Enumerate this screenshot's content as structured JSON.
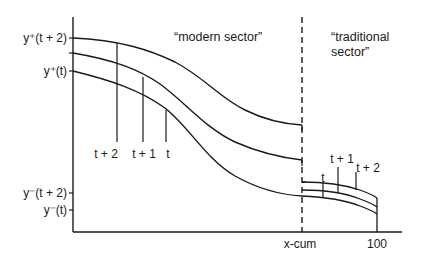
{
  "diagram": {
    "sector_labels": {
      "modern": "“modern sector”",
      "traditional_line1": "“traditional",
      "traditional_line2": "sector”"
    },
    "y_axis_labels": {
      "y_plus_t2": "y⁺(t + 2)",
      "y_plus_t": "y⁺(t)",
      "y_minus_t2": "y⁻(t + 2)",
      "y_minus_t": "y⁻(t)"
    },
    "x_axis_labels": {
      "xcum": "x-cum",
      "hundred": "100"
    },
    "modern_markers": {
      "t2": "t + 2",
      "t1": "t + 1",
      "t": "t"
    },
    "traditional_markers": {
      "t": "t",
      "t1": "t + 1",
      "t2": "t + 2"
    },
    "colors": {
      "ink": "#1a1a1a",
      "background": "#ffffff"
    }
  }
}
